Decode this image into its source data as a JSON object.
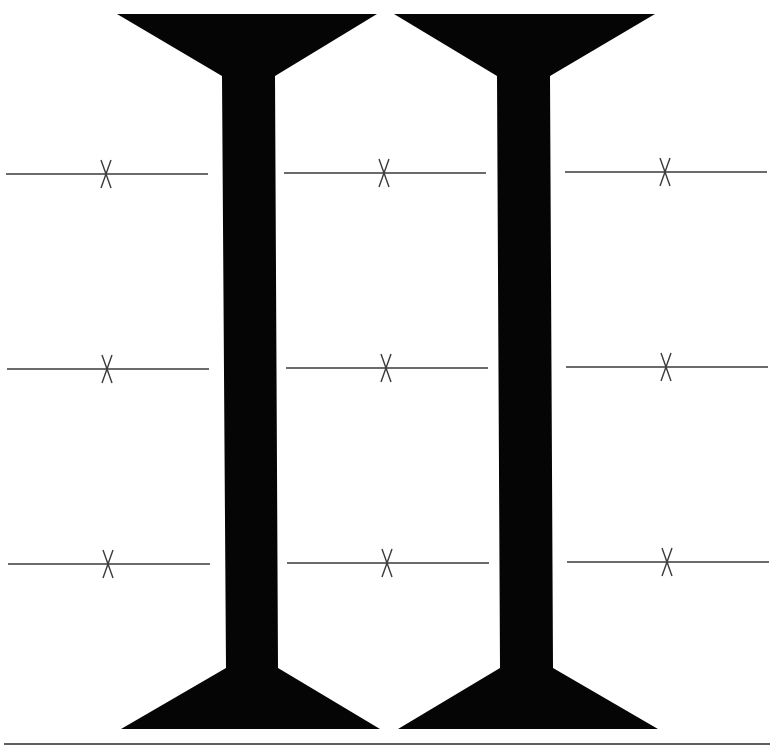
{
  "diagram": {
    "type": "structural-elevation",
    "canvas": {
      "width": 779,
      "height": 756,
      "background": "#ffffff"
    },
    "colors": {
      "pillar_fill": "#050505",
      "line_stroke": "#3a3a3a",
      "ground_stroke": "#2a2a2a"
    },
    "pillars": [
      {
        "id": "pillar-1",
        "top_cap": {
          "y_top": 14,
          "x_left": 117,
          "x_right": 377,
          "y_neck": 76
        },
        "stem": {
          "x_left_top": 222,
          "x_right_top": 275,
          "x_left_bottom": 226,
          "x_right_bottom": 278
        },
        "bottom_base": {
          "y_neck": 668,
          "y_bottom": 729,
          "x_left": 121,
          "x_right": 380
        }
      },
      {
        "id": "pillar-2",
        "top_cap": {
          "y_top": 14,
          "x_left": 394,
          "x_right": 655,
          "y_neck": 76
        },
        "stem": {
          "x_left_top": 497,
          "x_right_top": 550,
          "x_left_bottom": 500,
          "x_right_bottom": 553
        },
        "bottom_base": {
          "y_neck": 668,
          "y_bottom": 729,
          "x_left": 398,
          "x_right": 658
        }
      }
    ],
    "section_lines": [
      {
        "row": 1,
        "y": 174,
        "x1": 6,
        "x2": 208,
        "mark_x": 106
      },
      {
        "row": 1,
        "y": 173,
        "x1": 284,
        "x2": 486,
        "mark_x": 384
      },
      {
        "row": 1,
        "y": 172,
        "x1": 565,
        "x2": 767,
        "mark_x": 665
      },
      {
        "row": 2,
        "y": 369,
        "x1": 7,
        "x2": 209,
        "mark_x": 107
      },
      {
        "row": 2,
        "y": 368,
        "x1": 286,
        "x2": 488,
        "mark_x": 386
      },
      {
        "row": 2,
        "y": 367,
        "x1": 566,
        "x2": 768,
        "mark_x": 666
      },
      {
        "row": 3,
        "y": 564,
        "x1": 8,
        "x2": 210,
        "mark_x": 108
      },
      {
        "row": 3,
        "y": 563,
        "x1": 287,
        "x2": 489,
        "mark_x": 387
      },
      {
        "row": 3,
        "y": 562,
        "x1": 567,
        "x2": 769,
        "mark_x": 667
      }
    ],
    "mark": {
      "symbol": "x-cross",
      "half_width": 5,
      "half_height": 14
    },
    "ground_line": {
      "y": 744,
      "x1": 4,
      "x2": 770
    }
  }
}
